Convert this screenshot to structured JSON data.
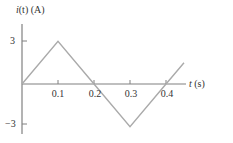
{
  "chart_data": {
    "type": "line",
    "title": "",
    "xlabel": "t (s)",
    "ylabel": "i(t) (A)",
    "x": [
      0,
      0.1,
      0.2,
      0.3,
      0.4,
      0.45
    ],
    "series": [
      {
        "name": "i(t)",
        "values": [
          0,
          3,
          0,
          -3,
          0,
          1.5
        ]
      }
    ],
    "x_ticks": [
      "0.1",
      "0.2",
      "0.3",
      "0.4"
    ],
    "y_ticks": [
      "3",
      "-3"
    ],
    "xlim": [
      0,
      0.5
    ],
    "ylim": [
      -3.3,
      4.3
    ],
    "grid": false,
    "legend": "none",
    "colors": {
      "line": "#aaaaaa",
      "axis": "#808080",
      "text": "#333333"
    }
  },
  "labels": {
    "ylabel_prefix": "i",
    "ylabel_rest": "(t) (A)",
    "xlabel_var": "t",
    "xlabel_unit": " (s)",
    "xticks": [
      "0.1",
      "0.2",
      "0.3",
      "0.4"
    ],
    "ytick_pos": "3",
    "ytick_neg": "−3"
  }
}
